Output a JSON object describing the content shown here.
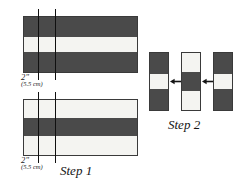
{
  "figure": {
    "colors": {
      "dark_fabric": "#4a4a4a",
      "light_fabric": "#f4f4f1",
      "outline": "#3a3a3a",
      "cut_line": "#101010",
      "text": "#141414",
      "background": "#ffffff"
    }
  },
  "step1": {
    "caption": "Step 1",
    "panels": [
      {
        "name": "top-strip-set",
        "bands": [
          {
            "shade": "dark",
            "height_pct": 36
          },
          {
            "shade": "light",
            "height_pct": 28
          },
          {
            "shade": "dark",
            "height_pct": 36
          }
        ]
      },
      {
        "name": "bottom-strip-set",
        "bands": [
          {
            "shade": "light",
            "height_pct": 32
          },
          {
            "shade": "dark",
            "height_pct": 34
          },
          {
            "shade": "light",
            "height_pct": 34
          }
        ]
      }
    ],
    "measurements": [
      {
        "inches": "2\"",
        "metric": "(5.5 cm)"
      },
      {
        "inches": "2\"",
        "metric": "(5.5 cm)"
      }
    ],
    "cut_lines": 4
  },
  "step2": {
    "caption": "Step 2",
    "strips": [
      {
        "name": "left-strip",
        "segments": [
          {
            "shade": "dark",
            "height_pct": 36
          },
          {
            "shade": "light",
            "height_pct": 28
          },
          {
            "shade": "dark",
            "height_pct": 36
          }
        ]
      },
      {
        "name": "middle-strip",
        "segments": [
          {
            "shade": "light",
            "height_pct": 33
          },
          {
            "shade": "dark",
            "height_pct": 33
          },
          {
            "shade": "light",
            "height_pct": 34
          }
        ]
      },
      {
        "name": "right-strip",
        "segments": [
          {
            "shade": "dark",
            "height_pct": 36
          },
          {
            "shade": "light",
            "height_pct": 28
          },
          {
            "shade": "dark",
            "height_pct": 36
          }
        ]
      }
    ],
    "arrows": [
      {
        "name": "arrow-between-left-and-middle",
        "direction": "left"
      },
      {
        "name": "arrow-between-middle-and-right",
        "direction": "left"
      }
    ]
  }
}
